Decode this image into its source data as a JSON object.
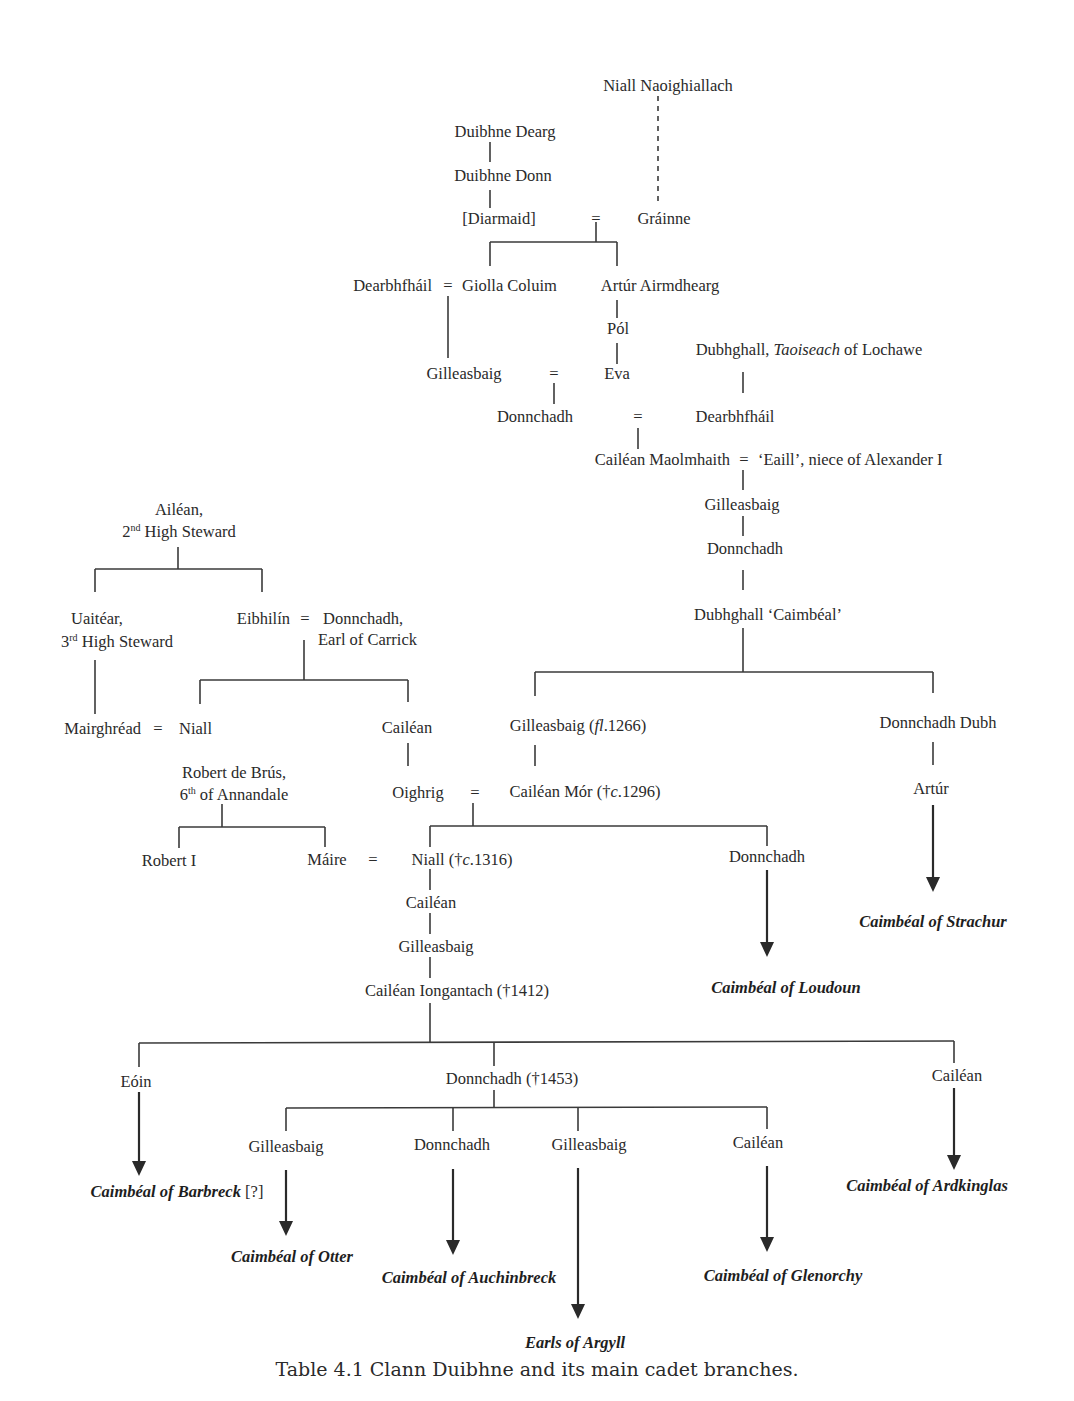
{
  "caption": "Table 4.1  Clann Duibhne and its main cadet branches.",
  "people": {
    "niall_naoighiallach": "Niall Naoighiallach",
    "duibhne_dearg": "Duibhne Dearg",
    "duibhne_donn": "Duibhne Donn",
    "diarmaid": "[Diarmaid]",
    "grainne": "Gráinne",
    "dearbhfhail_1": "Dearbhfháil",
    "giolla_coluim": "Giolla Coluim",
    "artur_airmdhearg": "Artúr Airmdhearg",
    "pol": "Pól",
    "gilleasbaig_1": "Gilleasbaig",
    "eva": "Eva",
    "dubhghall_taoiseach_pre": "Dubhghall, ",
    "dubhghall_taoiseach_it": "Taoiseach",
    "dubhghall_taoiseach_post": " of Lochawe",
    "donnchadh_1": "Donnchadh",
    "dearbhfhail_2": "Dearbhfháil",
    "cailean_maolmhaith": "Cailéan Maolmhaith",
    "eaill": "‘Eaill’, niece of Alexander I",
    "gilleasbaig_2": "Gilleasbaig",
    "donnchadh_2": "Donnchadh",
    "dubhghall_caimbeal": "Dubhghall ‘Caimbéal’",
    "ailean_1": "Ailéan,",
    "ailean_2_num": "2",
    "ailean_2_sup": "nd",
    "ailean_2_rest": " High Steward",
    "uaitear_1": "Uaitéar,",
    "uaitear_2_num": "3",
    "uaitear_2_sup": "rd",
    "uaitear_2_rest": " High Steward",
    "eibhilin": "Eibhilín",
    "donnchadh_carrick_1": "Donnchadh,",
    "donnchadh_carrick_2": "Earl of Carrick",
    "mairghread": "Mairghréad",
    "niall_1": "Niall",
    "cailean_1": "Cailéan",
    "robert_bruce_1": "Robert de Brús,",
    "robert_bruce_2_num": "6",
    "robert_bruce_2_sup": "th",
    "robert_bruce_2_rest": " of Annandale",
    "oighrig": "Oighrig",
    "gilleasbaig_fl_pre": "Gilleasbaig (",
    "gilleasbaig_fl_it": "fl",
    "gilleasbaig_fl_post": ".1266)",
    "donnchadh_dubh": "Donnchadh Dubh",
    "cailean_mor_pre": "Cailéan Mór (†",
    "cailean_mor_it": "c",
    "cailean_mor_post": ".1296)",
    "artur": "Artúr",
    "robert_i": "Robert I",
    "maire": "Máire",
    "niall_1316_pre": "Niall (†",
    "niall_1316_it": "c",
    "niall_1316_post": ".1316)",
    "donnchadh_3": "Donnchadh",
    "cailean_2": "Cailéan",
    "gilleasbaig_3": "Gilleasbaig",
    "cailean_iongantach": "Cailéan Iongantach (†1412)",
    "eoin": "Eóin",
    "donnchadh_1453": "Donnchadh (†1453)",
    "cailean_3": "Cailéan",
    "gilleasbaig_4": "Gilleasbaig",
    "donnchadh_4": "Donnchadh",
    "gilleasbaig_5": "Gilleasbaig",
    "cailean_4": "Cailéan"
  },
  "marriage_symbol": "=",
  "branches": {
    "strachur": "Caimbéal of Strachur",
    "loudoun": "Caimbéal of Loudoun",
    "barbreck": "Caimbéal of Barbreck",
    "barbreck_note": " [?]",
    "ardkinglas": "Caimbéal of Ardkinglas",
    "otter": "Caimbéal of Otter",
    "auchinbreck": "Caimbéal of Auchinbreck",
    "glenorchy": "Caimbéal of Glenorchy",
    "argyll": "Earls of Argyll"
  }
}
